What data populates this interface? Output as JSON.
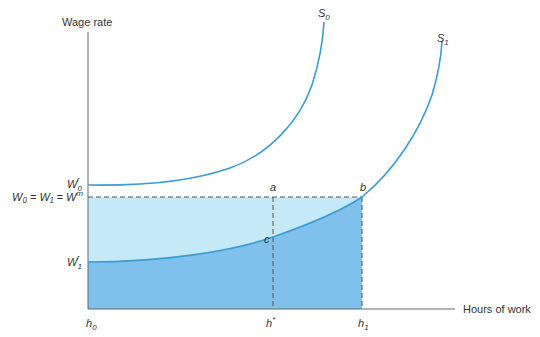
{
  "diagram": {
    "y_axis_label": "Wage rate",
    "x_axis_label": "Hours of work",
    "curves": [
      {
        "name": "S",
        "sub": "0"
      },
      {
        "name": "S",
        "sub": "1"
      }
    ],
    "y_ticks": {
      "w0r": {
        "base": "W",
        "sub": "0",
        "sup": "r"
      },
      "w1r": {
        "base": "W",
        "sub": "1",
        "sup": "r"
      },
      "wm": {
        "text": "W₀ = W₁ = W",
        "sup": "m"
      }
    },
    "x_ticks": {
      "h0": {
        "base": "h",
        "sub": "0"
      },
      "hstar": {
        "base": "h",
        "sup": "*"
      },
      "h1": {
        "base": "h",
        "sub": "1"
      }
    },
    "points": {
      "a": "a",
      "b": "b",
      "c": "c"
    },
    "colors": {
      "curve": "#3a9bd5",
      "light_fill": "#c6e9f8",
      "dark_fill": "#7fc1ec",
      "axis": "#555555",
      "dash": "#555555"
    }
  }
}
